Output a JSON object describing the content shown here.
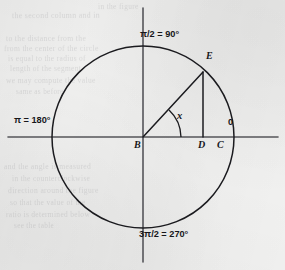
{
  "figure": {
    "name": "unit-circle-angle-diagram",
    "background_color": "#f1f1f0",
    "ink_color": "#16161a",
    "axis_color": "#4a4a4f",
    "canvas": {
      "width": 285,
      "height": 270
    },
    "geometry": {
      "center": {
        "x": 143,
        "y": 137,
        "label": "B"
      },
      "radius": 91,
      "horizontal_axis": {
        "x1": 8,
        "x2": 278,
        "y": 137
      },
      "vertical_axis": {
        "x": 143,
        "y1": 8,
        "y2": 262
      },
      "point_E": {
        "x": 203,
        "y": 72
      },
      "point_D": {
        "x": 203,
        "y": 137
      },
      "point_C": {
        "x": 233,
        "y": 137
      },
      "angle_arc_radius": 38,
      "angle_degrees": 47
    },
    "axis_labels": [
      {
        "id": "quarter-turn",
        "text": "π/2 = 90°",
        "position": "top",
        "x": 140,
        "y": 29
      },
      {
        "id": "half-turn",
        "text": "π = 180°",
        "position": "left",
        "x": 14,
        "y": 115
      },
      {
        "id": "three-quarter-turn",
        "text": "3π/2 = 270°",
        "position": "bottom",
        "x": 139,
        "y": 229
      },
      {
        "id": "zero-angle",
        "text": "0",
        "position": "right",
        "x": 228,
        "y": 117
      }
    ],
    "point_labels": [
      {
        "id": "center-point-label",
        "text": "B",
        "x": 134,
        "y": 139
      },
      {
        "id": "foot-point-label",
        "text": "D",
        "x": 198,
        "y": 139
      },
      {
        "id": "circle-right-point-label",
        "text": "C",
        "x": 217,
        "y": 139
      },
      {
        "id": "terminal-point-label",
        "text": "E",
        "x": 206,
        "y": 50
      }
    ],
    "angle_label": {
      "id": "angle-x-label",
      "text": "x",
      "x": 177,
      "y": 110
    },
    "ghost_text": [
      {
        "text": "in the figure",
        "x": 98,
        "y": 2,
        "size": 7.4,
        "rotate": -0.4
      },
      {
        "text": "the second column and in",
        "x": 12,
        "y": 11,
        "size": 7.8,
        "rotate": -0.3
      },
      {
        "text": "to the distance from the",
        "x": 6,
        "y": 34,
        "size": 7.6,
        "rotate": -0.2
      },
      {
        "text": "from the center of the circle",
        "x": 4,
        "y": 44,
        "size": 7.6,
        "rotate": -0.2
      },
      {
        "text": "is equal to the radius of",
        "x": 8,
        "y": 54,
        "size": 7.4,
        "rotate": -0.2
      },
      {
        "text": "length of the segment",
        "x": 10,
        "y": 64,
        "size": 7.4,
        "rotate": -0.2
      },
      {
        "text": "we may compute the value",
        "x": 6,
        "y": 76,
        "size": 7.6,
        "rotate": -0.2
      },
      {
        "text": "same as before",
        "x": 16,
        "y": 88,
        "size": 7.2,
        "rotate": -0.2
      },
      {
        "text": "and the angle is measured",
        "x": 4,
        "y": 162,
        "size": 7.6,
        "rotate": -0.2
      },
      {
        "text": "in the counterclockwise",
        "x": 12,
        "y": 174,
        "size": 7.4,
        "rotate": -0.2
      },
      {
        "text": "direction around the figure",
        "x": 8,
        "y": 186,
        "size": 7.6,
        "rotate": -0.2
      },
      {
        "text": "so that the value of the",
        "x": 10,
        "y": 198,
        "size": 7.4,
        "rotate": -0.2
      },
      {
        "text": "ratio is determined below",
        "x": 6,
        "y": 210,
        "size": 7.4,
        "rotate": -0.2
      },
      {
        "text": "see the table",
        "x": 14,
        "y": 222,
        "size": 7.2,
        "rotate": -0.2
      }
    ]
  }
}
